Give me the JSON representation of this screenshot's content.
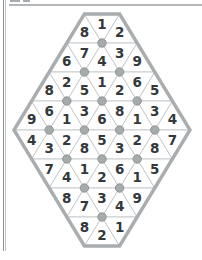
{
  "page": {
    "background": "#ffffff",
    "left_rule_color": "#8f9496",
    "top_rule_color": "#b4b7b9"
  },
  "puzzle": {
    "type": "triangle-number-diamond",
    "rows": [
      {
        "start": "up",
        "values": [
          "8",
          "1",
          "2"
        ]
      },
      {
        "start": "up",
        "values": [
          "6",
          "7",
          "4",
          "3",
          "9"
        ]
      },
      {
        "start": "up",
        "values": [
          "8",
          "2",
          "5",
          "1",
          "2",
          "6",
          "5"
        ]
      },
      {
        "start": "up",
        "values": [
          "9",
          "6",
          "1",
          "3",
          "6",
          "8",
          "1",
          "3",
          "4"
        ]
      },
      {
        "start": "down",
        "values": [
          "4",
          "3",
          "2",
          "8",
          "5",
          "3",
          "2",
          "8",
          "7"
        ]
      },
      {
        "start": "down",
        "values": [
          "7",
          "4",
          "1",
          "2",
          "6",
          "1",
          "5"
        ]
      },
      {
        "start": "down",
        "values": [
          "8",
          "7",
          "3",
          "4",
          "9"
        ]
      },
      {
        "start": "down",
        "values": [
          "8",
          "2",
          "1"
        ]
      }
    ],
    "dots": [
      {
        "line": 1,
        "offsets": [
          0
        ]
      },
      {
        "line": 2,
        "offsets": [
          -1,
          1
        ]
      },
      {
        "line": 3,
        "offsets": [
          -2,
          0,
          2
        ]
      },
      {
        "line": 4,
        "offsets": [
          -3,
          -1,
          1,
          3
        ]
      },
      {
        "line": 5,
        "offsets": [
          -2,
          0,
          2
        ]
      },
      {
        "line": 6,
        "offsets": [
          -1,
          1
        ]
      },
      {
        "line": 7,
        "offsets": [
          0
        ]
      }
    ],
    "colors": {
      "outline": "#a9adaf",
      "grid": "#c9cccd",
      "number": "#33383b",
      "dot_fill": "#a6abab",
      "dot_stroke": "#8f9595",
      "cell_fill": "#ffffff"
    }
  }
}
